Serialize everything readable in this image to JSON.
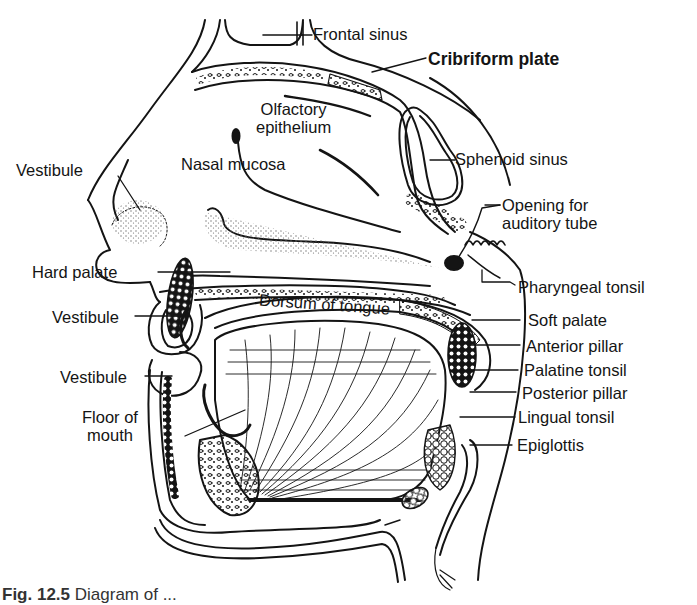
{
  "figure": {
    "caption_number": "Fig. 12.5",
    "caption_text": "Diagram of ..."
  },
  "labels": {
    "frontal_sinus": "Frontal sinus",
    "cribriform_plate": "Cribriform plate",
    "olfactory_epithelium": "Olfactory\nepithelium",
    "nasal_mucosa": "Nasal mucosa",
    "sphenoid_sinus": "Sphenoid sinus",
    "vestibule_nose": "Vestibule",
    "opening_auditory_tube": "Opening for\nauditory tube",
    "hard_palate": "Hard palate",
    "pharyngeal_tonsil": "Pharyngeal tonsil",
    "dorsum_of_tongue": "Dorsum of tongue",
    "vestibule_upper": "Vestibule",
    "soft_palate": "Soft palate",
    "anterior_pillar": "Anterior pillar",
    "vestibule_lower": "Vestibule",
    "palatine_tonsil": "Palatine tonsil",
    "posterior_pillar": "Posterior pillar",
    "floor_of_mouth": "Floor of\nmouth",
    "lingual_tonsil": "Lingual tonsil",
    "epiglottis": "Epiglottis"
  },
  "colors": {
    "ink": "#141414",
    "paper": "#ffffff",
    "stipple": "#6a6a6a"
  }
}
